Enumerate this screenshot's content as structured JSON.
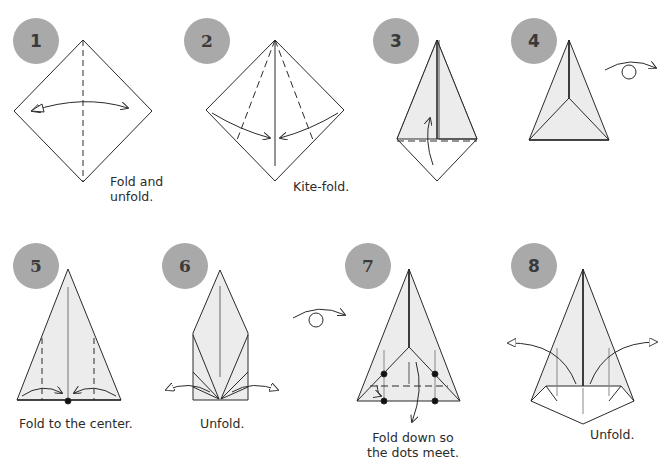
{
  "colors": {
    "badge": "#a9a9a9",
    "badge_text": "#3a3a3a",
    "paper_fill": "#ececec",
    "line": "#2a2a2a"
  },
  "steps": [
    {
      "number": "1",
      "caption_line1": "Fold and",
      "caption_line2": "unfold."
    },
    {
      "number": "2",
      "caption_line1": "Kite-fold.",
      "caption_line2": ""
    },
    {
      "number": "3",
      "caption_line1": "",
      "caption_line2": ""
    },
    {
      "number": "4",
      "caption_line1": "",
      "caption_line2": ""
    },
    {
      "number": "5",
      "caption_line1": "Fold to the center.",
      "caption_line2": ""
    },
    {
      "number": "6",
      "caption_line1": "Unfold.",
      "caption_line2": ""
    },
    {
      "number": "7",
      "caption_line1": "Fold down so",
      "caption_line2": "the dots meet."
    },
    {
      "number": "8",
      "caption_line1": "Unfold.",
      "caption_line2": ""
    }
  ],
  "icons": [
    "fold-arrow-icon",
    "turn-over-icon",
    "valley-fold-line",
    "dot-marker"
  ]
}
